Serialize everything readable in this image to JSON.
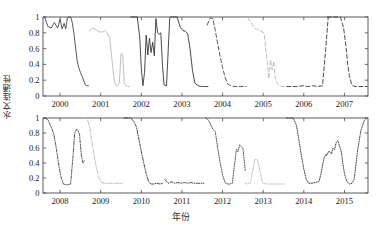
{
  "chart_data": {
    "type": "line",
    "title": "",
    "xlabel": "年份",
    "ylabel": "水文连通性",
    "ylim": [
      0,
      1
    ],
    "yticks": [
      0,
      0.2,
      0.4,
      0.6,
      0.8,
      1
    ],
    "ytick_labels": [
      "0",
      "0.2",
      "0.4",
      "0.6",
      "0.8",
      "1"
    ],
    "grid": false,
    "legend": "none",
    "panels": [
      {
        "name": "top-panel",
        "xlim": [
          1999.58,
          2007.58
        ],
        "xticks": [
          2000,
          2001,
          2002,
          2003,
          2004,
          2005,
          2006,
          2007
        ],
        "xtick_labels": [
          "2000",
          "2001",
          "2002",
          "2003",
          "2004",
          "2005",
          "2006",
          "2007"
        ],
        "series": [
          {
            "name": "2000",
            "style": "solid",
            "color": "#3a3a3a",
            "x": [
              1999.62,
              1999.7,
              1999.78,
              1999.86,
              1999.94,
              2000.0,
              2000.05,
              2000.1,
              2000.14,
              2000.18,
              2000.22,
              2000.26,
              2000.3,
              2000.34,
              2000.38,
              2000.42,
              2000.46,
              2000.5,
              2000.54,
              2000.58,
              2000.62,
              2000.66,
              2000.7
            ],
            "y": [
              1.0,
              0.88,
              0.86,
              0.93,
              0.86,
              0.97,
              0.85,
              0.92,
              0.85,
              0.99,
              1.0,
              1.0,
              0.93,
              0.8,
              0.62,
              0.45,
              0.36,
              0.3,
              0.25,
              0.2,
              0.14,
              0.13,
              0.13
            ]
          },
          {
            "name": "2001",
            "style": "solid",
            "color": "#b4b4b4",
            "x": [
              2000.72,
              2000.8,
              2000.88,
              2000.96,
              2001.04,
              2001.1,
              2001.16,
              2001.22,
              2001.28,
              2001.34,
              2001.38,
              2001.42,
              2001.46,
              2001.5,
              2001.54,
              2001.58,
              2001.62,
              2001.66,
              2001.7
            ],
            "y": [
              0.82,
              0.86,
              0.84,
              0.81,
              0.81,
              0.83,
              0.8,
              0.74,
              0.45,
              0.17,
              0.13,
              0.13,
              0.17,
              0.54,
              0.52,
              0.17,
              0.13,
              0.12,
              0.12
            ]
          },
          {
            "name": "2002",
            "style": "solid",
            "color": "#2b2b2b",
            "x": [
              2001.74,
              2001.82,
              2001.9,
              2001.96,
              2002.0,
              2002.04,
              2002.08,
              2002.12,
              2002.16,
              2002.2,
              2002.24,
              2002.28,
              2002.32,
              2002.36,
              2002.4,
              2002.44,
              2002.48,
              2002.52,
              2002.56,
              2002.62,
              2002.7
            ],
            "y": [
              1.0,
              1.0,
              1.0,
              0.75,
              0.35,
              0.13,
              0.3,
              0.77,
              0.52,
              0.73,
              0.55,
              0.68,
              0.51,
              0.98,
              0.8,
              0.78,
              0.8,
              0.4,
              0.14,
              0.13,
              0.99
            ]
          },
          {
            "name": "2003",
            "style": "solid",
            "color": "#2b2b2b",
            "x": [
              2002.72,
              2002.8,
              2002.88,
              2002.96,
              2003.02,
              2003.08,
              2003.14,
              2003.2,
              2003.26,
              2003.32,
              2003.4,
              2003.48,
              2003.56,
              2003.64
            ],
            "y": [
              1.0,
              1.0,
              1.0,
              0.87,
              0.83,
              0.82,
              0.79,
              0.6,
              0.32,
              0.16,
              0.13,
              0.12,
              0.12,
              0.12
            ]
          },
          {
            "name": "2004",
            "style": "dashed",
            "color": "#3a3a3a",
            "x": [
              2003.62,
              2003.7,
              2003.76,
              2003.82,
              2003.88,
              2003.94,
              2004.0,
              2004.06,
              2004.12,
              2004.2,
              2004.3,
              2004.4,
              2004.5,
              2004.58
            ],
            "y": [
              0.9,
              0.99,
              0.98,
              0.83,
              0.66,
              0.5,
              0.36,
              0.24,
              0.16,
              0.13,
              0.12,
              0.12,
              0.12,
              0.12
            ]
          },
          {
            "name": "2005",
            "style": "dashed",
            "color": "#b4b4b4",
            "x": [
              2004.62,
              2004.7,
              2004.78,
              2004.86,
              2004.94,
              2005.02,
              2005.08,
              2005.14,
              2005.18,
              2005.22,
              2005.26,
              2005.3,
              2005.34,
              2005.4,
              2005.48,
              2005.56
            ],
            "y": [
              0.99,
              0.93,
              0.86,
              0.84,
              0.82,
              0.8,
              0.52,
              0.22,
              0.46,
              0.33,
              0.44,
              0.22,
              0.16,
              0.13,
              0.12,
              0.12
            ]
          },
          {
            "name": "2006",
            "style": "dashed",
            "color": "#2b2b2b",
            "x": [
              2005.58,
              2005.7,
              2005.84,
              2005.98,
              2006.1,
              2006.22,
              2006.34,
              2006.46,
              2006.54,
              2006.6
            ],
            "y": [
              0.12,
              0.12,
              0.12,
              0.13,
              0.12,
              0.13,
              0.12,
              0.13,
              0.6,
              0.99
            ]
          },
          {
            "name": "2007",
            "style": "dashed",
            "color": "#2b2b2b",
            "x": [
              2006.58,
              2006.7,
              2006.8,
              2006.9,
              2006.98,
              2007.04,
              2007.08,
              2007.12,
              2007.18,
              2007.26,
              2007.36,
              2007.46,
              2007.56
            ],
            "y": [
              1.0,
              1.0,
              1.0,
              1.0,
              0.86,
              0.62,
              0.4,
              0.26,
              0.14,
              0.12,
              0.12,
              0.12,
              0.12
            ]
          }
        ]
      },
      {
        "name": "bottom-panel",
        "xlim": [
          2007.58,
          2015.58
        ],
        "xticks": [
          2008,
          2009,
          2010,
          2011,
          2012,
          2013,
          2014,
          2015
        ],
        "xtick_labels": [
          "2008",
          "2009",
          "2010",
          "2011",
          "2012",
          "2013",
          "2014",
          "2015"
        ],
        "series": [
          {
            "name": "2008",
            "style": "dashdot",
            "color": "#3a3a3a",
            "x": [
              2007.62,
              2007.7,
              2007.78,
              2007.84,
              2007.9,
              2007.96,
              2008.02,
              2008.08,
              2008.14,
              2008.2,
              2008.26,
              2008.32,
              2008.36,
              2008.4,
              2008.44,
              2008.48,
              2008.52,
              2008.56,
              2008.6
            ],
            "y": [
              1.0,
              0.98,
              0.88,
              0.8,
              0.62,
              0.4,
              0.22,
              0.12,
              0.11,
              0.11,
              0.12,
              0.5,
              0.8,
              0.85,
              0.84,
              0.78,
              0.52,
              0.4,
              0.43
            ]
          },
          {
            "name": "2009",
            "style": "dashdot",
            "color": "#b4b4b4",
            "x": [
              2008.6,
              2008.66,
              2008.72,
              2008.78,
              2008.84,
              2008.9,
              2008.96,
              2009.02,
              2009.1,
              2009.2,
              2009.32,
              2009.44,
              2009.54
            ],
            "y": [
              1.0,
              1.0,
              0.9,
              0.7,
              0.5,
              0.32,
              0.2,
              0.14,
              0.13,
              0.13,
              0.13,
              0.13,
              0.13
            ]
          },
          {
            "name": "2010",
            "style": "dashdot",
            "color": "#2b2b2b",
            "x": [
              2009.58,
              2009.66,
              2009.74,
              2009.82,
              2009.88,
              2009.94,
              2010.0,
              2010.06,
              2010.12,
              2010.18,
              2010.24,
              2010.3,
              2010.38,
              2010.46,
              2010.54
            ],
            "y": [
              1.0,
              1.0,
              1.0,
              0.95,
              0.88,
              0.72,
              0.55,
              0.4,
              0.26,
              0.15,
              0.12,
              0.12,
              0.13,
              0.12,
              0.13
            ]
          },
          {
            "name": "2011",
            "style": "dashdot",
            "color": "#2b2b2b",
            "x": [
              2010.58,
              2010.66,
              2010.74,
              2010.82,
              2010.9,
              2010.98,
              2011.06,
              2011.14,
              2011.22,
              2011.3,
              2011.38,
              2011.46,
              2011.54
            ],
            "y": [
              0.18,
              0.13,
              0.15,
              0.13,
              0.14,
              0.13,
              0.14,
              0.13,
              0.14,
              0.13,
              0.13,
              0.13,
              0.13
            ]
          },
          {
            "name": "2012",
            "style": "dotted",
            "color": "#3a3a3a",
            "x": [
              2011.58,
              2011.64,
              2011.7,
              2011.76,
              2011.82,
              2011.88,
              2011.94,
              2012.0,
              2012.06,
              2012.12,
              2012.18,
              2012.24,
              2012.3,
              2012.34,
              2012.38,
              2012.42,
              2012.46,
              2012.5,
              2012.56
            ],
            "y": [
              1.0,
              0.98,
              0.92,
              0.85,
              0.82,
              0.6,
              0.4,
              0.24,
              0.14,
              0.12,
              0.12,
              0.13,
              0.4,
              0.58,
              0.55,
              0.64,
              0.62,
              0.6,
              0.3
            ]
          },
          {
            "name": "2013",
            "style": "dotted",
            "color": "#b4b4b4",
            "x": [
              2012.56,
              2012.62,
              2012.68,
              2012.74,
              2012.8,
              2012.86,
              2012.92,
              2012.98,
              2013.06,
              2013.16,
              2013.28,
              2013.4,
              2013.52
            ],
            "y": [
              0.13,
              0.12,
              0.13,
              0.3,
              0.45,
              0.44,
              0.3,
              0.14,
              0.12,
              0.12,
              0.12,
              0.12,
              0.12
            ]
          },
          {
            "name": "2014",
            "style": "dotted",
            "color": "#2b2b2b",
            "x": [
              2013.58,
              2013.66,
              2013.74,
              2013.82,
              2013.88,
              2013.94,
              2014.0,
              2014.06,
              2014.12,
              2014.2,
              2014.3,
              2014.38,
              2014.44,
              2014.5,
              2014.56
            ],
            "y": [
              1.0,
              1.0,
              1.0,
              0.9,
              0.7,
              0.5,
              0.32,
              0.18,
              0.13,
              0.13,
              0.14,
              0.16,
              0.3,
              0.48,
              0.52
            ]
          },
          {
            "name": "2015",
            "style": "dotted",
            "color": "#2b2b2b",
            "x": [
              2014.56,
              2014.62,
              2014.68,
              2014.72,
              2014.76,
              2014.8,
              2014.84,
              2014.88,
              2014.92,
              2014.96,
              2015.0,
              2015.06,
              2015.12,
              2015.18,
              2015.24,
              2015.32,
              2015.4,
              2015.48,
              2015.54
            ],
            "y": [
              0.5,
              0.56,
              0.52,
              0.6,
              0.58,
              0.68,
              0.7,
              0.62,
              0.56,
              0.4,
              0.26,
              0.15,
              0.12,
              0.13,
              0.18,
              0.55,
              0.82,
              0.96,
              1.0
            ]
          }
        ]
      }
    ]
  }
}
